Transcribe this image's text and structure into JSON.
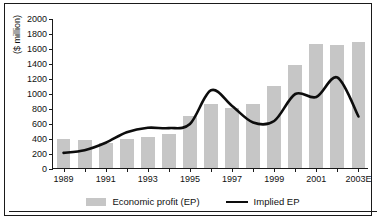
{
  "chart_data": {
    "type": "bar",
    "title": "",
    "xlabel": "",
    "ylabel": "($ million)",
    "ylim": [
      0,
      2000
    ],
    "ytick_values": [
      0,
      200,
      400,
      600,
      800,
      1000,
      1200,
      1400,
      1600,
      1800,
      2000
    ],
    "ytick_labels": [
      "0",
      "200",
      "400",
      "600",
      "800",
      "1000",
      "1200",
      "1400",
      "1600",
      "1800",
      "2000"
    ],
    "grid": false,
    "legend_position": "bottom",
    "categories": [
      "1989",
      "1990",
      "1991",
      "1992",
      "1993",
      "1994",
      "1995",
      "1996",
      "1997",
      "1998",
      "1999",
      "2000",
      "2001",
      "2002",
      "2003E"
    ],
    "xtick_labels": [
      "1989",
      "1991",
      "1993",
      "1995",
      "1997",
      "1999",
      "2001",
      "2003E"
    ],
    "series": [
      {
        "name": "Economic profit (EP)",
        "type": "bar",
        "color": "#c6c6c6",
        "values": [
          385,
          375,
          335,
          390,
          415,
          450,
          700,
          850,
          795,
          860,
          1090,
          1380,
          1655,
          1635,
          1680
        ]
      },
      {
        "name": "Implied EP",
        "type": "line",
        "color": "#0d0d0d",
        "values": [
          215,
          250,
          350,
          490,
          550,
          545,
          600,
          1050,
          840,
          620,
          640,
          1000,
          960,
          1220,
          700
        ]
      }
    ]
  },
  "legend": {
    "items": [
      {
        "label": "Economic profit (EP)",
        "marker": "bar-swatch"
      },
      {
        "label": "Implied EP",
        "marker": "line-swatch"
      }
    ]
  },
  "axis": {
    "y_title": "($ million)"
  }
}
